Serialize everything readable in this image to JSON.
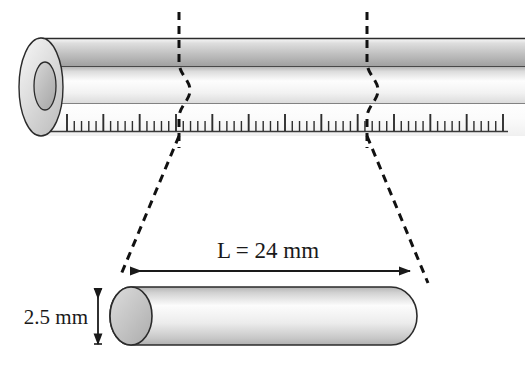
{
  "figure": {
    "labels": {
      "length": "L = 24 mm",
      "diameter": "2.5 mm"
    },
    "measurements": {
      "length_value": "24",
      "length_symbol": "L",
      "length_unit": "mm",
      "diameter_value": "2.5",
      "diameter_unit": "mm"
    },
    "ruler": {
      "minor_tick_count": 60,
      "major_every": 5,
      "description": "millimetre scale printed along tube"
    },
    "colors": {
      "outline": "#1a1a1a",
      "tube_wall_light": "#f2f2f2",
      "tube_wall_mid": "#c9c9c9",
      "tube_wall_dark": "#a8a8a8",
      "cap_fill": "#bdbdbd",
      "background": "#ffffff",
      "dash": "#111111",
      "text": "#1a1a1a"
    },
    "parts": {
      "tube": "long-tube",
      "tube_end_annulus": "tube-end-annulus",
      "cut_line_left": "cut-line-left",
      "cut_line_right": "cut-line-right",
      "projector_left": "projector-line-left",
      "projector_right": "projector-line-right",
      "segment": "extracted-cylinder-segment",
      "length_arrow": "length-dimension-arrow",
      "diameter_arrow": "diameter-dimension-arrow"
    }
  }
}
